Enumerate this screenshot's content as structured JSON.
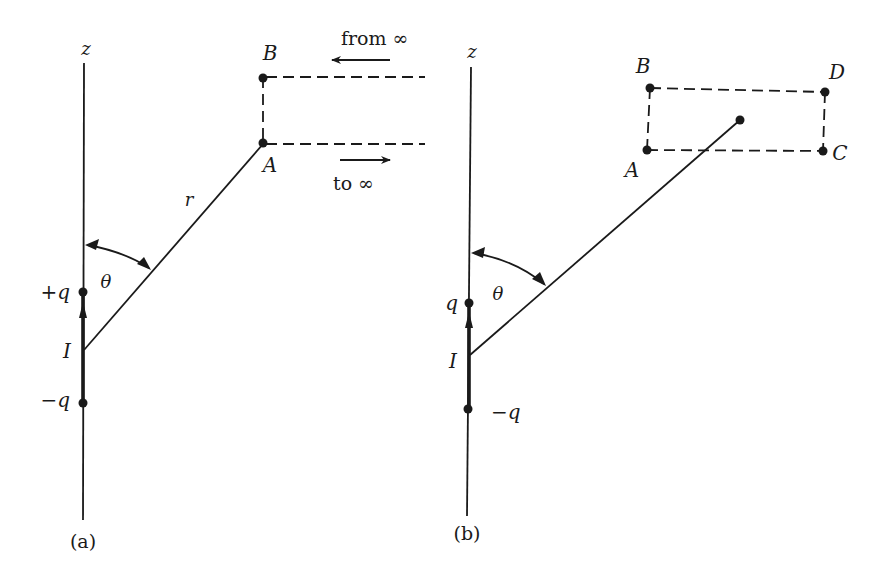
{
  "figure": {
    "panel_a": {
      "caption": "(a)",
      "axis_label": "z",
      "labels": {
        "plus_charge": "+q",
        "minus_charge": "−q",
        "origin": "I",
        "radius": "r",
        "angle": "θ",
        "point_a": "A",
        "point_b": "B",
        "from_inf": "from ∞",
        "to_inf": "to ∞"
      }
    },
    "panel_b": {
      "caption": "(b)",
      "axis_label": "z",
      "labels": {
        "plus_charge": "q",
        "minus_charge": "−q",
        "origin": "I",
        "angle": "θ",
        "point_a": "A",
        "point_b": "B",
        "point_c": "C",
        "point_d": "D"
      }
    }
  }
}
